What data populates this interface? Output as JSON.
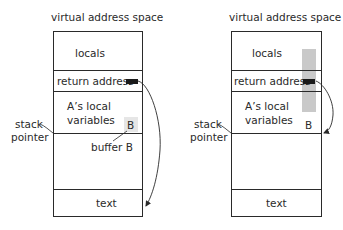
{
  "diagrams": [
    {
      "title": "virtual address space",
      "regions": {
        "locals": "locals",
        "return_address": "return address",
        "a_locals_line1": "A’s local",
        "a_locals_line2": "variables",
        "buffer_label": "B",
        "buffer_caption": "buffer B",
        "text": "text"
      },
      "stack_pointer": {
        "line1": "stack",
        "line2": "pointer"
      }
    },
    {
      "title": "virtual address space",
      "regions": {
        "locals": "locals",
        "return_address": "return address",
        "a_locals_line1": "A’s local",
        "a_locals_line2": "variables",
        "buffer_label": "B",
        "text": "text"
      },
      "stack_pointer": {
        "line1": "stack",
        "line2": "pointer"
      }
    }
  ],
  "colors": {
    "line": "#2a2a2a",
    "return_marker": "#1a1a1a",
    "overflow_fill": "#c9c9c9",
    "buffer_fill": "#e6e6e6"
  }
}
